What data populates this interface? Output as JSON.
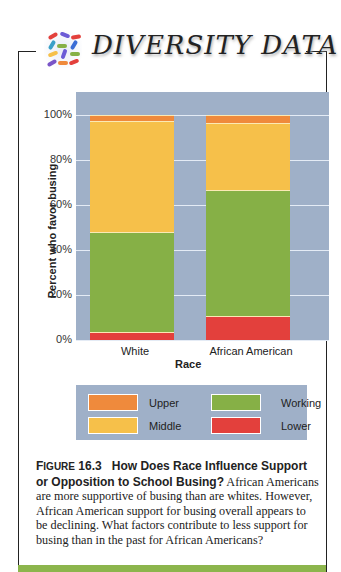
{
  "header": {
    "title": "DIVERSITY DATA",
    "logo_icon": "colorful-pills-mosaic-icon"
  },
  "colors": {
    "Upper": "#ef8a3c",
    "Middle": "#f6c04a",
    "Working": "#86b046",
    "Lower": "#e3403c",
    "plot_bg": "#9fb0c8",
    "accent_bar": "#8cb54c"
  },
  "chart_data": {
    "type": "bar",
    "stacked": true,
    "title": "",
    "xlabel": "Race",
    "ylabel": "Percent who favor busing",
    "ylim": [
      0,
      100
    ],
    "yticks": [
      "0%",
      "20%",
      "40%",
      "60%",
      "80%",
      "100%"
    ],
    "categories": [
      "White",
      "African American"
    ],
    "series": [
      {
        "name": "Lower",
        "values": [
          3.5,
          10.5
        ]
      },
      {
        "name": "Working",
        "values": [
          44.5,
          56
        ]
      },
      {
        "name": "Middle",
        "values": [
          49.5,
          30
        ]
      },
      {
        "name": "Upper",
        "values": [
          2.5,
          3.5
        ]
      }
    ],
    "grid": true,
    "legend": {
      "position": "bottom",
      "entries": [
        "Upper",
        "Working",
        "Middle",
        "Lower"
      ]
    }
  },
  "caption": {
    "figure_label_first": "F",
    "figure_label_rest": "IGURE",
    "figure_number": "16.3",
    "heading": "How Does Race Influence Support or Opposition to School Busing?",
    "body": "African Americans are more supportive of busing than are whites. However, African American support for busing overall appears to be declining. What factors contribute to less support for busing than in the past for African Americans?"
  }
}
